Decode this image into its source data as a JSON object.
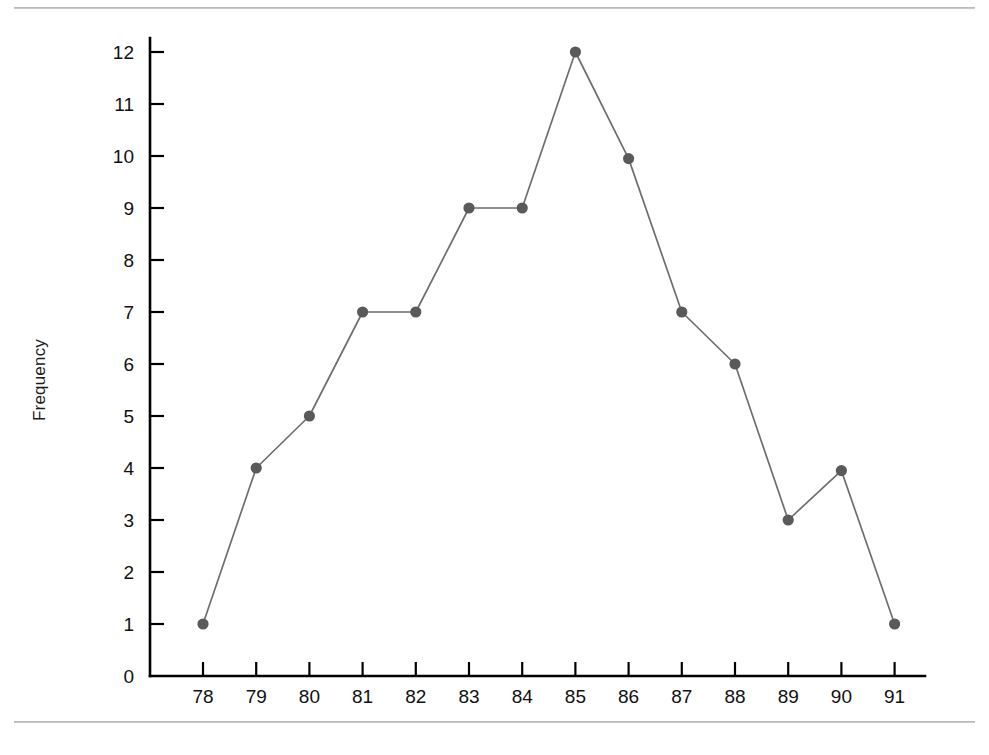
{
  "figure": {
    "top_rule": "divider",
    "bottom_rule": "divider"
  },
  "chart_data": {
    "type": "line",
    "title": "",
    "subtitle": "",
    "xlabel": "",
    "ylabel": "Frequency",
    "x": [
      78,
      79,
      80,
      81,
      82,
      83,
      84,
      85,
      86,
      87,
      88,
      89,
      90,
      91
    ],
    "values": [
      1,
      4,
      5,
      7,
      7,
      9,
      9,
      12,
      9.95,
      7,
      6,
      3,
      3.95,
      1
    ],
    "series": [
      {
        "name": "Frequency",
        "values": [
          1,
          4,
          5,
          7,
          7,
          9,
          9,
          12,
          9.95,
          7,
          6,
          3,
          3.95,
          1
        ]
      }
    ],
    "xtick_labels": [
      "78",
      "79",
      "80",
      "81",
      "82",
      "83",
      "84",
      "85",
      "86",
      "87",
      "88",
      "89",
      "90",
      "91"
    ],
    "ytick_labels": [
      "0",
      "1",
      "2",
      "3",
      "4",
      "5",
      "6",
      "7",
      "8",
      "9",
      "10",
      "11",
      "12"
    ],
    "xlim": [
      77.4,
      91.6
    ],
    "ylim": [
      0,
      12.4
    ],
    "grid": false,
    "legend": false,
    "marker": "circle",
    "marker_color": "#5a5a5a",
    "line_color": "#6e6e6e",
    "axis_color": "#000000",
    "background_color": "#ffffff"
  }
}
